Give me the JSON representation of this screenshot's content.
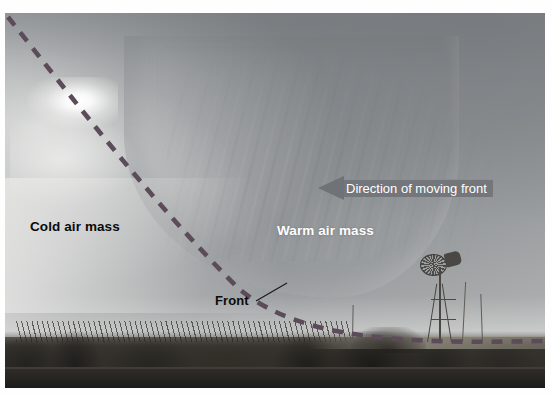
{
  "figure": {
    "kind": "annotated-photograph"
  },
  "annotations": {
    "cold_air_label": "Cold air mass",
    "warm_air_label": "Warm air mass",
    "front_label": "Front",
    "direction_label": "Direction of moving front"
  },
  "icons": {
    "front_line": "dashed-front-line-icon",
    "front_leader": "leader-line-icon",
    "direction_arrow": "left-arrow-icon",
    "windmill": "windmill-icon",
    "utility_pole": "utility-pole-icon"
  },
  "colors": {
    "front_dash": "#5c4b59",
    "arrow_fill": "#73767a",
    "arrow_head_fill": "#6f7276",
    "cold_label_text": "#0b0b0b",
    "warm_label_text": "#ffffff",
    "sky_light": "#b9babb",
    "sky_dark": "#7e8286",
    "ground_dark": "#2b2926"
  }
}
